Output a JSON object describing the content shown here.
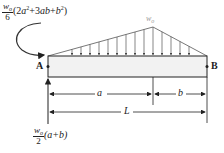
{
  "diagram": {
    "moment_label": {
      "coef_num": "w",
      "coef_num_sub": "o",
      "coef_den": "6",
      "expr_open": "(2",
      "a": "a",
      "sq1": "2",
      "plus1": "+3",
      "ab": "ab",
      "plus2": "+",
      "b": "b",
      "sq2": "2",
      "close": ")"
    },
    "reaction_label": {
      "coef_num": "w",
      "coef_num_sub": "o",
      "coef_den": "2",
      "expr": "(a+b)"
    },
    "load_label": {
      "main": "w",
      "sub": "o"
    },
    "support_left": "A",
    "support_right": "B",
    "dimensions": {
      "a": "a",
      "b": "b",
      "L": "L"
    },
    "colors": {
      "beam_fill": "#f2f2f2",
      "line": "#222222",
      "load_line": "#555555",
      "load_label": "#999999"
    }
  }
}
